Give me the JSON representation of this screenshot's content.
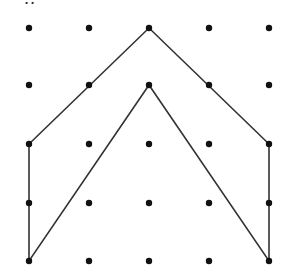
{
  "caption_fragment": "..",
  "grid": {
    "cols_x": [
      29,
      89,
      149,
      209,
      269
    ],
    "rows_y": [
      28,
      85,
      144,
      203,
      261
    ],
    "dot_radius": 3.2,
    "dot_color": "#111111"
  },
  "polygon": {
    "stroke": "#333333",
    "vertices": [
      [
        0,
        4
      ],
      [
        0,
        2
      ],
      [
        2,
        0
      ],
      [
        4,
        2
      ],
      [
        4,
        4
      ],
      [
        2,
        1
      ]
    ]
  }
}
